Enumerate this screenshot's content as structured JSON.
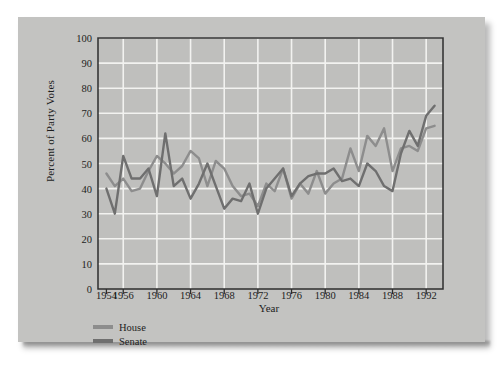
{
  "chart_data": {
    "type": "line",
    "title": "",
    "xlabel": "Year",
    "ylabel": "Percent of Party Votes",
    "xlim": [
      1953,
      1994
    ],
    "ylim": [
      0,
      100
    ],
    "grid": true,
    "legend_position": "below-left",
    "yticks": [
      0,
      10,
      20,
      30,
      40,
      50,
      60,
      70,
      80,
      90,
      100
    ],
    "xticks": [
      1954,
      1956,
      1960,
      1964,
      1968,
      1972,
      1976,
      1980,
      1984,
      1988,
      1992
    ],
    "x": [
      1954,
      1955,
      1956,
      1957,
      1958,
      1959,
      1960,
      1961,
      1962,
      1963,
      1964,
      1965,
      1966,
      1967,
      1968,
      1969,
      1970,
      1971,
      1972,
      1973,
      1974,
      1975,
      1976,
      1977,
      1978,
      1979,
      1980,
      1981,
      1982,
      1983,
      1984,
      1985,
      1986,
      1987,
      1988,
      1989,
      1990,
      1991,
      1992,
      1993
    ],
    "series": [
      {
        "name": "House",
        "color": "#8d8d8d",
        "values": [
          46,
          41,
          44,
          39,
          40,
          47,
          53,
          50,
          46,
          49,
          55,
          52,
          41,
          51,
          48,
          41,
          37,
          38,
          33,
          42,
          39,
          48,
          36,
          42,
          38,
          47,
          38,
          42,
          44,
          56,
          47,
          61,
          57,
          64,
          47,
          56,
          57,
          55,
          64,
          65
        ],
        "linewidth": 2.4
      },
      {
        "name": "Senate",
        "color": "#6f6f6f",
        "values": [
          40,
          30,
          53,
          44,
          44,
          48,
          37,
          62,
          41,
          44,
          36,
          42,
          50,
          41,
          32,
          36,
          35,
          42,
          30,
          40,
          44,
          48,
          37,
          42,
          45,
          46,
          46,
          48,
          43,
          44,
          41,
          50,
          47,
          41,
          39,
          54,
          63,
          57,
          69,
          73
        ],
        "linewidth": 2.4
      }
    ]
  },
  "legend": {
    "items": [
      {
        "label": "House"
      },
      {
        "label": "Senate"
      }
    ]
  },
  "colors": {
    "page_background": "#c3c3c1",
    "plot_background": "#bfbfbd",
    "gridline": "#f2f2f0",
    "frame": "#2e2e2e",
    "text": "#1d1d1d",
    "house_line": "#8d8d8d",
    "senate_line": "#6f6f6f"
  }
}
